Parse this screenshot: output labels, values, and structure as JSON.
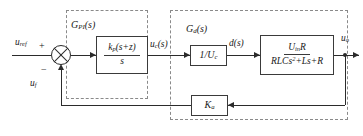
{
  "diagram": {
    "groups": [
      {
        "label": "G_PI(s)",
        "label_html": "G<sub>PI</sub>(s)"
      },
      {
        "label": "G_d(s)",
        "label_html": "G<sub>d</sub>(s)"
      }
    ],
    "blocks": {
      "pi_controller": {
        "numerator": "k_p(s+z)",
        "denominator": "s"
      },
      "inverse_uc": {
        "expression": "1/U_c"
      },
      "plant": {
        "numerator": "U_in R",
        "denominator": "RLCs^2+Ls+R"
      },
      "feedback_gain": {
        "expression": "K_a"
      }
    },
    "signals": {
      "reference": "u_ref",
      "feedback": "u_f",
      "controller_output": "u_c(s)",
      "duty": "d(s)",
      "output": "u_o"
    },
    "summing_junction": {
      "positive_sign": "+",
      "negative_sign": "−"
    },
    "colors": {
      "line": "#2b2b2b",
      "dashed_border": "#8a8a8a",
      "background": "#ffffff"
    }
  }
}
